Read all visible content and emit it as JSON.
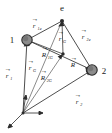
{
  "figure": {
    "background_color": "#ffffff",
    "line_color": "#3a3a3a",
    "node_fill": "#8c8c8c",
    "node_stroke": "#2b2b2b",
    "label_color": "#1a1a1a"
  },
  "nodes": [
    {
      "id": "body-1",
      "label": "1",
      "x": 27,
      "y": 40,
      "r": 5.2,
      "label_x": 12,
      "label_y": 40
    },
    {
      "id": "body-2",
      "label": "2",
      "x": 92,
      "y": 70,
      "r": 5.2,
      "label_x": 103,
      "label_y": 72
    },
    {
      "id": "point-e",
      "label": "e",
      "x": 62,
      "y": 21,
      "r": 2.2,
      "label_x": 61,
      "label_y": 12
    },
    {
      "id": "center-of-mass",
      "label": "",
      "x": 63,
      "y": 54,
      "r": 1.8,
      "label_x": 0,
      "label_y": 0
    },
    {
      "id": "origin",
      "label": "",
      "x": 23,
      "y": 113,
      "r": 1.6,
      "label_x": 0,
      "label_y": 0
    }
  ],
  "vectors": [
    {
      "id": "r1",
      "symbol": "r",
      "subscript": "1",
      "from": "origin",
      "to": "body-1",
      "label_x": 8,
      "label_y": 74
    },
    {
      "id": "r2",
      "symbol": "r",
      "subscript": "2",
      "from": "origin",
      "to": "body-2",
      "label_x": 75,
      "label_y": 100
    },
    {
      "id": "rG",
      "symbol": "r",
      "subscript": "G",
      "from": "origin",
      "to": "center-of-mass",
      "label_x": 30,
      "label_y": 66
    },
    {
      "id": "r1e",
      "symbol": "r",
      "subscript": "1e",
      "from": "body-1",
      "to": "point-e",
      "label_x": 34,
      "label_y": 24
    },
    {
      "id": "r2e",
      "symbol": "r",
      "subscript": "2e",
      "from": "body-2",
      "to": "point-e",
      "label_x": 82,
      "label_y": 35
    },
    {
      "id": "rGe",
      "symbol": "r",
      "subscript": "G",
      "from": "center-of-mass",
      "to": "point-e",
      "label_x": 60,
      "label_y": 38
    },
    {
      "id": "Rvec",
      "symbol": "R",
      "subscript": "",
      "from": "body-1",
      "to": "body-2",
      "label_x": 72,
      "label_y": 64
    },
    {
      "id": "R1G",
      "symbol": "R",
      "subscript": "1G",
      "from": "body-1",
      "to": "center-of-mass",
      "label_x": 44,
      "label_y": 54
    },
    {
      "id": "R2G",
      "symbol": "R",
      "subscript": "2G",
      "from": "origin",
      "to": "center-of-mass",
      "label_x": 43,
      "label_y": 77
    }
  ],
  "axes": [
    {
      "id": "axis-x",
      "label": "",
      "x1": 23,
      "y1": 113,
      "x2": 42,
      "y2": 113
    },
    {
      "id": "axis-y",
      "label": "",
      "x1": 23,
      "y1": 113,
      "x2": 26,
      "y2": 96
    },
    {
      "id": "axis-z",
      "label": "",
      "x1": 23,
      "y1": 113,
      "x2": 8,
      "y2": 128
    }
  ],
  "edges": [
    {
      "id": "edge-1-2",
      "from": "body-1",
      "to": "body-2"
    },
    {
      "id": "edge-1-e",
      "from": "body-1",
      "to": "point-e"
    },
    {
      "id": "edge-2-e",
      "from": "body-2",
      "to": "point-e"
    },
    {
      "id": "edge-1-G",
      "from": "body-1",
      "to": "center-of-mass"
    },
    {
      "id": "edge-G-e",
      "from": "center-of-mass",
      "to": "point-e"
    },
    {
      "id": "edge-o-1",
      "from": "origin",
      "to": "body-1"
    },
    {
      "id": "edge-o-2",
      "from": "origin",
      "to": "body-2"
    },
    {
      "id": "edge-o-G",
      "from": "origin",
      "to": "center-of-mass"
    },
    {
      "id": "edge-o-e",
      "from": "origin",
      "to": "point-e"
    }
  ]
}
